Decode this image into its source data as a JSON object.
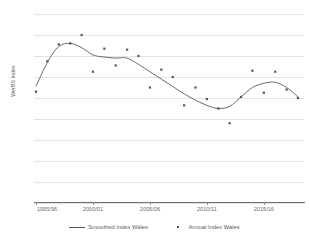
{
  "chart_data": {
    "type": "scatter",
    "title": "",
    "subtitle": "",
    "xlabel": "",
    "ylabel": "WerBS Index",
    "ylim": [
      0,
      180
    ],
    "ytick_step": 20,
    "yticks": [
      0,
      20,
      40,
      60,
      80,
      100,
      120,
      140,
      160,
      180
    ],
    "grid": true,
    "legend_position": "bottom",
    "x": [
      "1995/96",
      "1996/97",
      "1997/98",
      "1998/99",
      "1999/00",
      "2000/01",
      "2001/02",
      "2002/03",
      "2003/04",
      "2004/05",
      "2005/06",
      "2006/07",
      "2007/08",
      "2008/09",
      "2009/10",
      "2010/11",
      "2011/12",
      "2012/13",
      "2013/14",
      "2014/15",
      "2015/16",
      "2016/17",
      "2017/18",
      "2018/19"
    ],
    "xtick_labels": [
      "1995/96",
      "2000/01",
      "2005/06",
      "2010/11",
      "2015/16"
    ],
    "xtick_indices": [
      0,
      5,
      10,
      15,
      20
    ],
    "series": [
      {
        "name": "Smoothed Index Wales",
        "kind": "line",
        "color": "#595959",
        "values": [
          111,
          134,
          149,
          152,
          148,
          141,
          139,
          138,
          138,
          132,
          125,
          118,
          111,
          104,
          98,
          93,
          90,
          92,
          101,
          110,
          114,
          115,
          110,
          101
        ]
      },
      {
        "name": "Annual Index Wales",
        "kind": "scatter",
        "color": "#555555",
        "values": [
          106,
          135,
          151,
          152,
          160,
          125,
          147,
          131,
          146,
          140,
          110,
          127,
          120,
          93,
          110,
          99,
          90,
          76,
          101,
          126,
          105,
          125,
          108,
          100
        ]
      }
    ]
  },
  "legend": {
    "items": [
      {
        "label": "Smoothed Index Wales",
        "marker": "line"
      },
      {
        "label": "Annual Index Wales",
        "marker": "dot"
      }
    ]
  },
  "axes": {
    "y_title": "WerBS Index"
  }
}
